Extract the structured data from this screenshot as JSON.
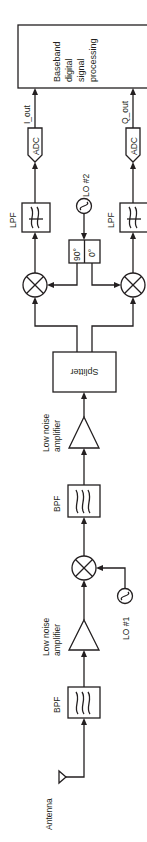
{
  "diagram": {
    "orientation": "rotated 90 degrees counter-clockwise",
    "colors": {
      "stroke": "#231f20",
      "background": "#ffffff"
    },
    "blocks": {
      "antenna": {
        "label": "Antenna"
      },
      "bpf1": {
        "label": "BPF"
      },
      "lna1": {
        "label_line1": "Low noise",
        "label_line2": "amplifier"
      },
      "lo1": {
        "label": "LO #1"
      },
      "mixer1": {
        "label": ""
      },
      "bpf2": {
        "label": "BPF"
      },
      "lna2": {
        "label_line1": "Low noise",
        "label_line2": "amplifier"
      },
      "splitter": {
        "label": "Splitter"
      },
      "mixer_i": {
        "label": ""
      },
      "mixer_q": {
        "label": ""
      },
      "phase_shifter": {
        "label_90": "90°",
        "label_0": "0°"
      },
      "lo2": {
        "label": "LO #2"
      },
      "lpf_i": {
        "label": "LPF"
      },
      "lpf_q": {
        "label": "LPF"
      },
      "adc_i": {
        "label": "ADC"
      },
      "adc_q": {
        "label": "ADC"
      },
      "i_out": {
        "label": "I_out"
      },
      "q_out": {
        "label": "Q_out"
      },
      "baseband": {
        "line1": "Baseband",
        "line2": "digital",
        "line3": "signal",
        "line4": "processing"
      }
    },
    "connections": [
      [
        "Antenna",
        "BPF"
      ],
      [
        "BPF",
        "Low noise amplifier"
      ],
      [
        "Low noise amplifier",
        "Mixer 1"
      ],
      [
        "LO #1",
        "Mixer 1"
      ],
      [
        "Mixer 1",
        "BPF"
      ],
      [
        "BPF",
        "Low noise amplifier"
      ],
      [
        "Low noise amplifier",
        "Splitter"
      ],
      [
        "Splitter",
        "Mixer I"
      ],
      [
        "Splitter",
        "Mixer Q"
      ],
      [
        "LO #2",
        "90°/0° phase shifter"
      ],
      [
        "90°",
        "Mixer I"
      ],
      [
        "0°",
        "Mixer Q"
      ],
      [
        "Mixer I",
        "LPF"
      ],
      [
        "Mixer Q",
        "LPF"
      ],
      [
        "LPF",
        "ADC (I)"
      ],
      [
        "LPF",
        "ADC (Q)"
      ],
      [
        "ADC (I)",
        "Baseband digital signal processing (I_out)"
      ],
      [
        "ADC (Q)",
        "Baseband digital signal processing (Q_out)"
      ]
    ]
  }
}
